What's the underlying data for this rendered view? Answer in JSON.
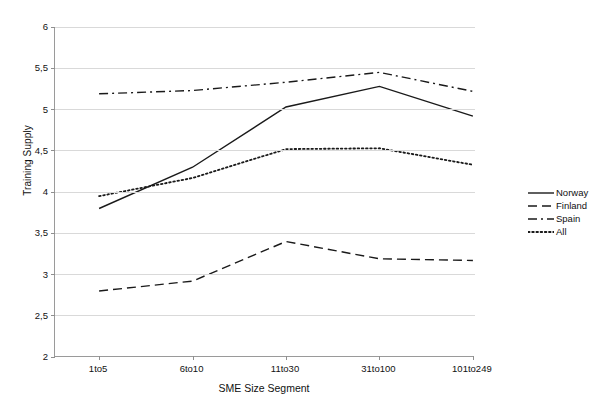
{
  "chart_data": {
    "type": "line",
    "title": "",
    "xlabel": "SME Size Segment",
    "ylabel": "Training Supply",
    "categories": [
      "1to5",
      "6to10",
      "11to30",
      "31to100",
      "101to249"
    ],
    "ylim": [
      2,
      6
    ],
    "ytick_labels": [
      "6",
      "5,5",
      "5",
      "4,5",
      "4",
      "3,5",
      "3",
      "2,5",
      "2"
    ],
    "ytick_values": [
      6,
      5.5,
      5,
      4.5,
      4,
      3.5,
      3,
      2.5,
      2
    ],
    "grid": true,
    "legend_position": "right",
    "decimal_separator": ",",
    "series": [
      {
        "name": "Norway",
        "style": "solid",
        "color": "#1a1a1a",
        "values": [
          3.8,
          4.3,
          5.03,
          5.28,
          4.92
        ]
      },
      {
        "name": "Finland",
        "style": "dashed",
        "color": "#1a1a1a",
        "values": [
          2.8,
          2.92,
          3.4,
          3.19,
          3.17
        ]
      },
      {
        "name": "Spain",
        "style": "dash-dot",
        "color": "#1a1a1a",
        "values": [
          5.19,
          5.23,
          5.33,
          5.45,
          5.22
        ]
      },
      {
        "name": "All",
        "style": "dotted",
        "color": "#1a1a1a",
        "values": [
          3.95,
          4.17,
          4.52,
          4.53,
          4.33
        ]
      }
    ]
  }
}
